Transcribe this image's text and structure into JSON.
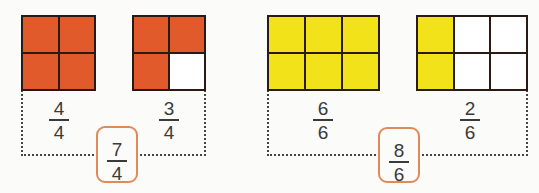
{
  "colors": {
    "orange": "#e05a2b",
    "yellow": "#f2e21a",
    "empty": "#ffffff",
    "box_border": "#e08a5a"
  },
  "groups": [
    {
      "color": "orange",
      "models": [
        {
          "rows": 2,
          "cols": 2,
          "shaded": 4,
          "numerator": "4",
          "denominator": "4"
        },
        {
          "rows": 2,
          "cols": 2,
          "shaded": 3,
          "numerator": "3",
          "denominator": "4"
        }
      ],
      "sum": {
        "numerator": "7",
        "denominator": "4"
      }
    },
    {
      "color": "yellow",
      "models": [
        {
          "rows": 2,
          "cols": 3,
          "shaded": 6,
          "numerator": "6",
          "denominator": "6"
        },
        {
          "rows": 2,
          "cols": 3,
          "shaded": 2,
          "numerator": "2",
          "denominator": "6",
          "shaded_columns": [
            0
          ]
        }
      ],
      "sum": {
        "numerator": "8",
        "denominator": "6"
      }
    }
  ]
}
